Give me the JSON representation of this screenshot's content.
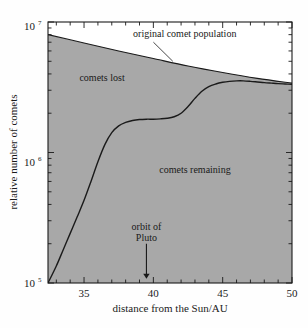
{
  "chart_data": {
    "type": "area",
    "title": "",
    "subtitle": "",
    "xlabel": "distance from the Sun/AU",
    "ylabel": "relative number of comets",
    "xlim": [
      32.4,
      50
    ],
    "ylim": [
      100000,
      10000000
    ],
    "yscale": "log",
    "xscale": "linear",
    "grid": false,
    "legend_position": "inline-annotations",
    "x_ticks_major": [
      35,
      40,
      45,
      50
    ],
    "x_tick_labels": [
      "35",
      "40",
      "45",
      "50"
    ],
    "x_tick_minor_step": 1,
    "y_ticks_major": [
      100000,
      1000000,
      10000000
    ],
    "y_tick_labels": [
      "10⁵",
      "10⁶",
      "10⁷"
    ],
    "y_tick_mantissa": [
      "10",
      "10",
      "10"
    ],
    "y_tick_exponents": [
      "5",
      "6",
      "7"
    ],
    "series": [
      {
        "name": "original comet population",
        "kind": "line",
        "x": [
          32.4,
          35,
          37.5,
          40,
          42.5,
          45,
          47.5,
          50
        ],
        "values": [
          8000000,
          6900000,
          6000000,
          5250000,
          4600000,
          4100000,
          3700000,
          3400000
        ]
      },
      {
        "name": "comets remaining",
        "kind": "area",
        "x": [
          32.4,
          33,
          33.5,
          34,
          34.5,
          35,
          35.5,
          36,
          36.5,
          37,
          37.5,
          38,
          38.5,
          39,
          39.5,
          40,
          40.5,
          41,
          41.5,
          42,
          42.5,
          43,
          43.5,
          44,
          44.5,
          45,
          45.5,
          46,
          46.5,
          47,
          47.5,
          48,
          48.5,
          49,
          49.5,
          50
        ],
        "values": [
          100000,
          135000,
          180000,
          240000,
          320000,
          430000,
          600000,
          850000,
          1150000,
          1420000,
          1600000,
          1700000,
          1760000,
          1790000,
          1800000,
          1800000,
          1810000,
          1830000,
          1880000,
          2000000,
          2250000,
          2600000,
          2950000,
          3200000,
          3350000,
          3450000,
          3510000,
          3540000,
          3540000,
          3510000,
          3470000,
          3430000,
          3400000,
          3370000,
          3350000,
          3330000
        ]
      }
    ],
    "annotations": [
      {
        "name": "original-comet-population",
        "text": "original comet population",
        "text_x": 42.0,
        "text_y": 8200000,
        "leader_from_x": 40.0,
        "leader_from_y": 7000000,
        "leader_to_x": 41.4,
        "leader_to_y": 5000000
      },
      {
        "name": "comets-lost",
        "text": "comets lost",
        "text_x": 36.3,
        "text_y": 3500000
      },
      {
        "name": "comets-remaining",
        "text": "comets remaining",
        "text_x": 43.0,
        "text_y": 700000
      },
      {
        "name": "orbit-of-pluto",
        "text_line1": "orbit of",
        "text_line2": "Pluto",
        "arrow_x": 39.5,
        "arrow_top_y": 200000,
        "arrow_tip_y": 108000
      }
    ],
    "colors": {
      "page_background": "#fefefe",
      "plot_background": "#ffffff",
      "region_fill": "#a8a8a8",
      "curve_stroke": "#1a1a1a",
      "axis_stroke": "#1a1a1a",
      "text": "#1a1a1a"
    }
  },
  "figure": {
    "orbit_label_line1": "orbit of",
    "orbit_label_line2": "Pluto",
    "comets_lost_label": "comets lost",
    "comets_remaining_label": "comets remaining",
    "original_population_label": "original comet population",
    "x_axis_title": "distance from the Sun/AU",
    "y_axis_title": "relative number of comets",
    "xtick_35": "35",
    "xtick_40": "40",
    "xtick_45": "45",
    "xtick_50": "50",
    "ytick_5_base": "10",
    "ytick_5_exp": "5",
    "ytick_6_base": "10",
    "ytick_6_exp": "6",
    "ytick_7_base": "10",
    "ytick_7_exp": "7"
  }
}
